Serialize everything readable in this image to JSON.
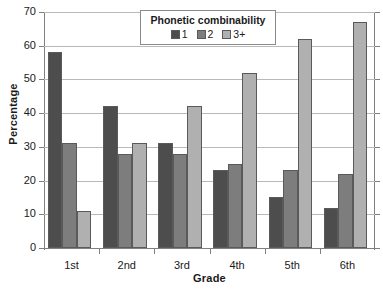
{
  "chart_data": {
    "type": "bar",
    "title": "",
    "xlabel": "Grade",
    "ylabel": "Percentage",
    "categories": [
      "1st",
      "2nd",
      "3rd",
      "4th",
      "5th",
      "6th"
    ],
    "series": [
      {
        "name": "1",
        "values": [
          58,
          42,
          31,
          23,
          15,
          12
        ],
        "color": "#4d4d4d"
      },
      {
        "name": "2",
        "values": [
          31,
          28,
          28,
          25,
          23,
          22
        ],
        "color": "#7d7d7d"
      },
      {
        "name": "3+",
        "values": [
          11,
          31,
          42,
          52,
          62,
          67
        ],
        "color": "#b0b0b0"
      }
    ],
    "ylim": [
      0,
      70
    ],
    "ytick_labels": [
      "0",
      "10",
      "20",
      "30",
      "40",
      "50",
      "60",
      "70"
    ],
    "ytick_values": [
      0,
      10,
      20,
      30,
      40,
      50,
      60,
      70
    ],
    "grid": true,
    "legend": {
      "title": "Phonetic combinability",
      "position": "top-center",
      "entries": [
        "1",
        "2",
        "3+"
      ]
    }
  }
}
